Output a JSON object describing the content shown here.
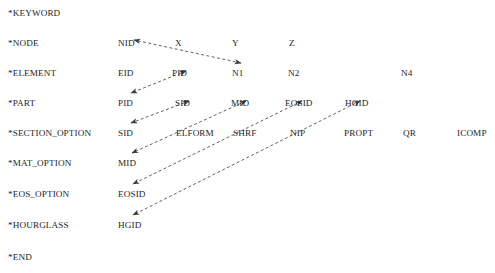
{
  "diagram": {
    "title_text": "LS-DYNA keyword card cross-reference diagram",
    "text_color": "#262626",
    "arrow_color": "#3a3a3a",
    "background": "#ffffff",
    "font_size_px": 9.2,
    "rows": [
      {
        "keyword": "*KEYWORD",
        "y": 8,
        "fields": []
      },
      {
        "keyword": "*NODE",
        "y": 38,
        "fields": [
          {
            "label": "NID",
            "x": 118
          },
          {
            "label": "X",
            "x": 175
          },
          {
            "label": "Y",
            "x": 232
          },
          {
            "label": "Z",
            "x": 289
          }
        ]
      },
      {
        "keyword": "*ELEMENT",
        "y": 68,
        "fields": [
          {
            "label": "EID",
            "x": 118
          },
          {
            "label": "PID",
            "x": 172
          },
          {
            "label": "N1",
            "x": 232
          },
          {
            "label": "N2",
            "x": 288
          },
          {
            "label": "N4",
            "x": 401
          }
        ]
      },
      {
        "keyword": "*PART",
        "y": 98,
        "fields": [
          {
            "label": "PID",
            "x": 118
          },
          {
            "label": "SID",
            "x": 175
          },
          {
            "label": "MID",
            "x": 231
          },
          {
            "label": "EOSID",
            "x": 285
          },
          {
            "label": "HGID",
            "x": 345
          }
        ]
      },
      {
        "keyword": "*SECTION_OPTION",
        "y": 128,
        "fields": [
          {
            "label": "SID",
            "x": 118
          },
          {
            "label": "ELFORM",
            "x": 176
          },
          {
            "label": "SHRF",
            "x": 233
          },
          {
            "label": "NIP",
            "x": 290
          },
          {
            "label": "PROPT",
            "x": 344
          },
          {
            "label": "QR",
            "x": 403
          },
          {
            "label": "ICOMP",
            "x": 457
          }
        ]
      },
      {
        "keyword": "*MAT_OPTION",
        "y": 158,
        "fields": [
          {
            "label": "MID",
            "x": 118
          }
        ]
      },
      {
        "keyword": "*EOS_OPTION",
        "y": 189,
        "fields": [
          {
            "label": "EOSID",
            "x": 118
          }
        ]
      },
      {
        "keyword": "*HOURGLASS",
        "y": 220,
        "fields": [
          {
            "label": "HGID",
            "x": 118
          }
        ]
      },
      {
        "keyword": "*END",
        "y": 252,
        "fields": []
      }
    ],
    "connections": [
      {
        "from": "ELEMENT.N1",
        "to": "NODE.NID",
        "x1": 241,
        "y1": 63,
        "x2": 134,
        "y2": 40
      },
      {
        "from": "ELEMENT.PID",
        "to": "PART.PID",
        "x1": 186,
        "y1": 71,
        "x2": 131,
        "y2": 93
      },
      {
        "from": "PART.SID",
        "to": "SECTION_OPTION.SID",
        "x1": 189,
        "y1": 101,
        "x2": 131,
        "y2": 123
      },
      {
        "from": "PART.MID",
        "to": "MAT_OPTION.MID",
        "x1": 246,
        "y1": 101,
        "x2": 132,
        "y2": 153
      },
      {
        "from": "PART.EOSID",
        "to": "EOS_OPTION.EOSID",
        "x1": 302,
        "y1": 101,
        "x2": 133,
        "y2": 184
      },
      {
        "from": "PART.HGID",
        "to": "HOURGLASS.HGID",
        "x1": 360,
        "y1": 101,
        "x2": 133,
        "y2": 215
      }
    ],
    "keyword_x": 8
  }
}
